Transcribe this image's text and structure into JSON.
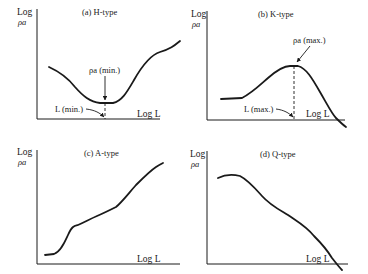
{
  "figure": {
    "panels": [
      {
        "id": "a",
        "title": "(a)  H-type",
        "ylabel_line1": "Log",
        "ylabel_line2": "ρa",
        "xlabel": "Log L",
        "annotations": {
          "extreme_value": "ρa (min.)",
          "extreme_position": "L (min.)"
        }
      },
      {
        "id": "b",
        "title": "(b)  K-type",
        "ylabel_line1": "Log",
        "ylabel_line2": "ρa",
        "xlabel": "Log L",
        "annotations": {
          "extreme_value": "ρa (max.)",
          "extreme_position": "L (max.)"
        }
      },
      {
        "id": "c",
        "title": "(c)  A-type",
        "ylabel_line1": "Log",
        "ylabel_line2": "ρa",
        "xlabel": "Log L"
      },
      {
        "id": "d",
        "title": "(d)  Q-type",
        "ylabel_line1": "Log",
        "ylabel_line2": "ρa",
        "xlabel": "Log L"
      }
    ]
  }
}
